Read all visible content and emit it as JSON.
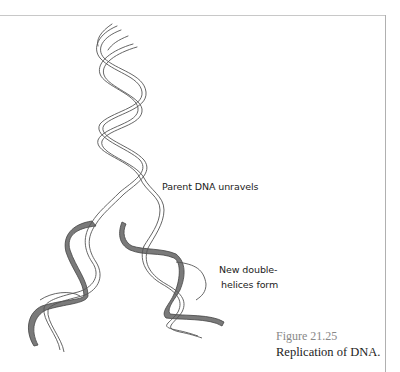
{
  "figure": {
    "labels": {
      "parent": "Parent DNA unravels",
      "new_line1": "New double-",
      "new_line2": "helices form"
    },
    "caption": {
      "number": "Figure 21.25",
      "title": "Replication of DNA."
    },
    "colors": {
      "strand_outline": "#555555",
      "new_strand_fill": "#7a7a7a",
      "frame": "#c0c0c0"
    }
  }
}
